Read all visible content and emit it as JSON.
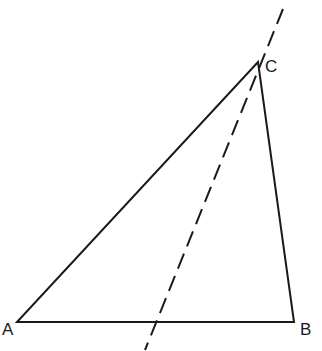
{
  "diagram": {
    "type": "triangle-with-line",
    "vertices": [
      {
        "id": "A",
        "label": "A",
        "x": 17,
        "y": 322
      },
      {
        "id": "B",
        "label": "B",
        "x": 294,
        "y": 322
      },
      {
        "id": "C",
        "label": "C",
        "x": 258,
        "y": 62
      }
    ],
    "edges": [
      [
        "A",
        "B"
      ],
      [
        "B",
        "C"
      ],
      [
        "C",
        "A"
      ]
    ],
    "dashed_line": {
      "x1": 283,
      "y1": 9,
      "x2": 145,
      "y2": 350,
      "passes_through": "C"
    },
    "colors": {
      "stroke": "#1a1a1a",
      "background": "#ffffff"
    }
  }
}
